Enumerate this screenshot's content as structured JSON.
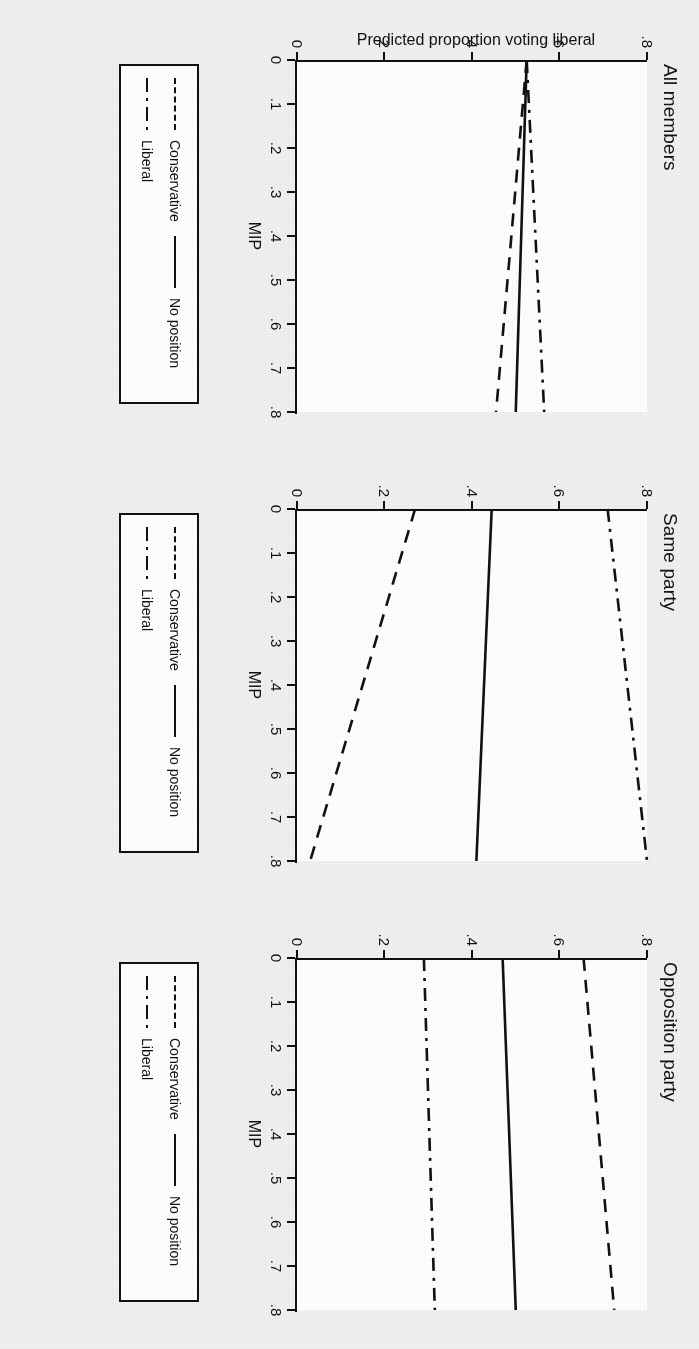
{
  "figure": {
    "y_axis_label": "Predicted proportion voting liberal",
    "x_axis_label": "MIP",
    "background_color": "#efefef",
    "line_color": "#111111"
  },
  "legend": {
    "entries": [
      {
        "label": "Conservative",
        "style": "dashed"
      },
      {
        "label": "Liberal",
        "style": "dashdot"
      },
      {
        "label": "No position",
        "style": "solid"
      }
    ]
  },
  "chart_data": [
    {
      "type": "line",
      "title": "All members",
      "xlabel": "MIP",
      "ylabel": "Predicted proportion voting liberal",
      "xlim": [
        0,
        0.8
      ],
      "ylim": [
        0,
        0.8
      ],
      "xticks": [
        "0",
        ".1",
        ".2",
        ".3",
        ".4",
        ".5",
        ".6",
        ".7",
        ".8"
      ],
      "yticks": [
        "0",
        ".2",
        ".4",
        ".6",
        ".8"
      ],
      "grid": false,
      "legend_position": "below",
      "x": [
        0,
        0.8
      ],
      "series": [
        {
          "name": "Conservative",
          "style": "dashed",
          "values": [
            0.525,
            0.455
          ]
        },
        {
          "name": "Liberal",
          "style": "dashdot",
          "values": [
            0.525,
            0.565
          ]
        },
        {
          "name": "No position",
          "style": "solid",
          "values": [
            0.525,
            0.5
          ]
        }
      ]
    },
    {
      "type": "line",
      "title": "Same party",
      "xlabel": "MIP",
      "ylabel": "Predicted proportion voting liberal",
      "xlim": [
        0,
        0.8
      ],
      "ylim": [
        0,
        0.8
      ],
      "xticks": [
        "0",
        ".1",
        ".2",
        ".3",
        ".4",
        ".5",
        ".6",
        ".7",
        ".8"
      ],
      "yticks": [
        "0",
        ".2",
        ".4",
        ".6",
        ".8"
      ],
      "grid": false,
      "legend_position": "below",
      "x": [
        0,
        0.8
      ],
      "series": [
        {
          "name": "Conservative",
          "style": "dashed",
          "values": [
            0.27,
            0.03
          ]
        },
        {
          "name": "Liberal",
          "style": "dashdot",
          "values": [
            0.71,
            0.8
          ]
        },
        {
          "name": "No position",
          "style": "solid",
          "values": [
            0.445,
            0.41
          ]
        }
      ]
    },
    {
      "type": "line",
      "title": "Opposition party",
      "xlabel": "MIP",
      "ylabel": "Predicted proportion voting liberal",
      "xlim": [
        0,
        0.8
      ],
      "ylim": [
        0,
        0.8
      ],
      "xticks": [
        "0",
        ".1",
        ".2",
        ".3",
        ".4",
        ".5",
        ".6",
        ".7",
        ".8"
      ],
      "yticks": [
        "0",
        ".2",
        ".4",
        ".6",
        ".8"
      ],
      "grid": false,
      "legend_position": "below",
      "x": [
        0,
        0.8
      ],
      "series": [
        {
          "name": "Conservative",
          "style": "dashed",
          "values": [
            0.655,
            0.725
          ]
        },
        {
          "name": "Liberal",
          "style": "dashdot",
          "values": [
            0.29,
            0.315
          ]
        },
        {
          "name": "No position",
          "style": "solid",
          "values": [
            0.47,
            0.5
          ]
        }
      ]
    }
  ]
}
